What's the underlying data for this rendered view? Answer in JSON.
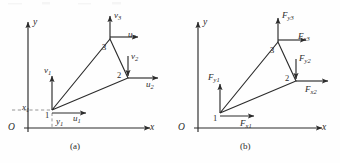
{
  "figure": {
    "kind": "engineering-diagram",
    "ink_color": "#2b2b2b",
    "background_color": "#fefefe",
    "dash_color": "#8a8a8a"
  },
  "panels": [
    {
      "id": "a",
      "caption": "(a)",
      "origin_label": "O",
      "axis_x_label": "x",
      "axis_y_label": "y",
      "nodes": [
        {
          "id": "n1",
          "number": "1"
        },
        {
          "id": "n2",
          "number": "2"
        },
        {
          "id": "n3",
          "number": "3"
        }
      ],
      "vectors": [
        {
          "id": "v1",
          "base": "v",
          "sub": "1",
          "direction": "up",
          "at_node": "1"
        },
        {
          "id": "u1",
          "base": "u",
          "sub": "1",
          "direction": "right",
          "at_node": "1"
        },
        {
          "id": "v2",
          "base": "v",
          "sub": "2",
          "direction": "down",
          "at_node": "2"
        },
        {
          "id": "u2",
          "base": "u",
          "sub": "2",
          "direction": "right",
          "at_node": "2"
        },
        {
          "id": "v3",
          "base": "v",
          "sub": "3",
          "direction": "up",
          "at_node": "3"
        },
        {
          "id": "u3",
          "base": "u",
          "sub": "3",
          "direction": "right",
          "at_node": "3"
        }
      ],
      "dimensions": [
        {
          "id": "x1",
          "base": "x",
          "sub": "1",
          "kind": "horizontal-offset"
        },
        {
          "id": "y1",
          "base": "y",
          "sub": "1",
          "kind": "vertical-offset"
        }
      ]
    },
    {
      "id": "b",
      "caption": "(b)",
      "origin_label": "O",
      "axis_x_label": "x",
      "axis_y_label": "y",
      "nodes": [
        {
          "id": "n1",
          "number": "1"
        },
        {
          "id": "n2",
          "number": "2"
        },
        {
          "id": "n3",
          "number": "3"
        }
      ],
      "vectors": [
        {
          "id": "Fy1",
          "base": "F",
          "sub": "y1",
          "direction": "up",
          "at_node": "1"
        },
        {
          "id": "Fx1",
          "base": "F",
          "sub": "x1",
          "direction": "right",
          "at_node": "1"
        },
        {
          "id": "Fy2",
          "base": "F",
          "sub": "y2",
          "direction": "down",
          "at_node": "2"
        },
        {
          "id": "Fx2",
          "base": "F",
          "sub": "x2",
          "direction": "right",
          "at_node": "2"
        },
        {
          "id": "Fy3",
          "base": "F",
          "sub": "y3",
          "direction": "up",
          "at_node": "3"
        },
        {
          "id": "Fx3",
          "base": "F",
          "sub": "x3",
          "direction": "right",
          "at_node": "3"
        }
      ],
      "dimensions": []
    }
  ],
  "labels": {
    "a": {
      "v1": "v",
      "v1s": "1",
      "u1": "u",
      "u1s": "1",
      "v2": "v",
      "v2s": "2",
      "u2": "u",
      "u2s": "2",
      "v3": "v",
      "v3s": "3",
      "u3": "u",
      "u3s": "3",
      "x1": "x",
      "x1s": "1",
      "y1": "y",
      "y1s": "1",
      "n1": "1",
      "n2": "2",
      "n3": "3",
      "origin": "O",
      "ax": "x",
      "ay": "y",
      "caption": "(a)"
    },
    "b": {
      "Fy1": "F",
      "Fy1s": "y1",
      "Fx1": "F",
      "Fx1s": "x1",
      "Fy2": "F",
      "Fy2s": "y2",
      "Fx2": "F",
      "Fx2s": "x2",
      "Fy3": "F",
      "Fy3s": "y3",
      "Fx3": "F",
      "Fx3s": "x3",
      "n1": "1",
      "n2": "2",
      "n3": "3",
      "origin": "O",
      "ax": "x",
      "ay": "y",
      "caption": "(b)"
    }
  }
}
